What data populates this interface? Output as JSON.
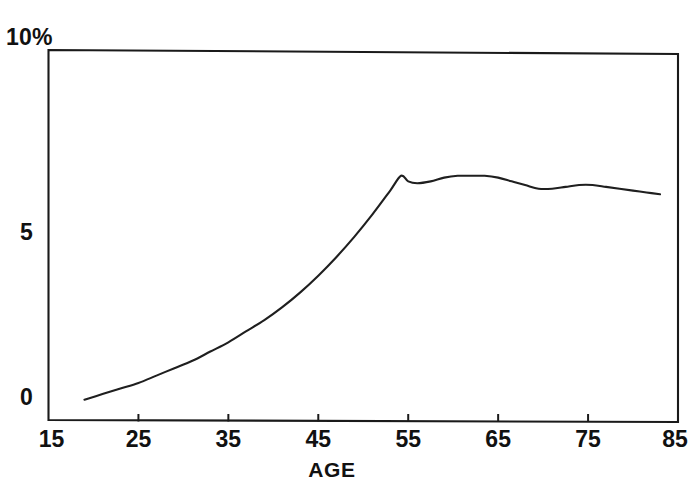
{
  "chart_data": {
    "type": "line",
    "title": "",
    "xlabel": "AGE",
    "ylabel": "",
    "xlim": [
      15,
      85
    ],
    "ylim": [
      0,
      10
    ],
    "grid": false,
    "legend": "none",
    "x_ticks": [
      15,
      25,
      35,
      45,
      55,
      65,
      75,
      85
    ],
    "x_tick_labels": [
      "15",
      "25",
      "35",
      "45",
      "55",
      "65",
      "75",
      "85"
    ],
    "y_ticks": [
      0,
      5,
      10
    ],
    "y_tick_labels": [
      "0",
      "5",
      "10%"
    ],
    "series": [
      {
        "name": "rate",
        "x": [
          19,
          21,
          23,
          25,
          27,
          29,
          31,
          33,
          35,
          37,
          39,
          41,
          43,
          45,
          47,
          49,
          51,
          53,
          54.2,
          55,
          56,
          57.5,
          59,
          60.5,
          62,
          63.5,
          65,
          66.5,
          68,
          69.5,
          71,
          72.5,
          74,
          75.5,
          77,
          78.5,
          80,
          81.5,
          83
        ],
        "y": [
          0.55,
          0.7,
          0.85,
          1.0,
          1.2,
          1.4,
          1.6,
          1.85,
          2.1,
          2.4,
          2.7,
          3.05,
          3.45,
          3.9,
          4.4,
          4.95,
          5.55,
          6.2,
          6.6,
          6.45,
          6.4,
          6.45,
          6.55,
          6.6,
          6.6,
          6.6,
          6.55,
          6.45,
          6.35,
          6.25,
          6.25,
          6.3,
          6.35,
          6.35,
          6.3,
          6.25,
          6.2,
          6.15,
          6.1
        ]
      }
    ]
  },
  "axes": {
    "y_top_label": "10%",
    "y_mid_label": "5",
    "y_bottom_label": "0",
    "x_title": "AGE",
    "x_labels": [
      "15",
      "25",
      "35",
      "45",
      "55",
      "65",
      "75",
      "85"
    ]
  },
  "colors": {
    "curve": "#1f1f1f",
    "frame": "#1a1a1a",
    "background": "#ffffff",
    "text": "#111111"
  }
}
